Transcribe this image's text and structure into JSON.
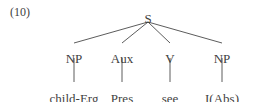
{
  "figure": {
    "example_number": "(10)",
    "width": 253,
    "height": 102,
    "background_color": "#ffffff",
    "line_color": "#4a4a4a",
    "text_color": "#3f3f3f"
  },
  "tree": {
    "root": {
      "label": "S",
      "x": 148,
      "y": 12,
      "branch_origin_x": 148,
      "branch_origin_y": 22
    },
    "categories": [
      {
        "label": "NP",
        "x": 74,
        "y": 52
      },
      {
        "label": "Aux",
        "x": 122,
        "y": 52
      },
      {
        "label": "V",
        "x": 170,
        "y": 52
      },
      {
        "label": "NP",
        "x": 222,
        "y": 52
      }
    ],
    "terminals": [
      {
        "label": "child-Erg",
        "x": 74,
        "y": 92
      },
      {
        "label": "Pres",
        "x": 122,
        "y": 92
      },
      {
        "label": "see",
        "x": 170,
        "y": 92
      },
      {
        "label": "I(Abs)",
        "x": 222,
        "y": 92
      }
    ],
    "branches": [
      {
        "x1": 148,
        "y1": 22,
        "x2": 74,
        "y2": 43
      },
      {
        "x1": 148,
        "y1": 22,
        "x2": 122,
        "y2": 43
      },
      {
        "x1": 148,
        "y1": 22,
        "x2": 170,
        "y2": 43
      },
      {
        "x1": 148,
        "y1": 22,
        "x2": 222,
        "y2": 43
      }
    ],
    "stems": [
      {
        "x1": 74,
        "y1": 58,
        "x2": 74,
        "y2": 82
      },
      {
        "x1": 122,
        "y1": 58,
        "x2": 122,
        "y2": 82
      },
      {
        "x1": 170,
        "y1": 58,
        "x2": 170,
        "y2": 82
      },
      {
        "x1": 222,
        "y1": 58,
        "x2": 222,
        "y2": 82
      }
    ]
  }
}
